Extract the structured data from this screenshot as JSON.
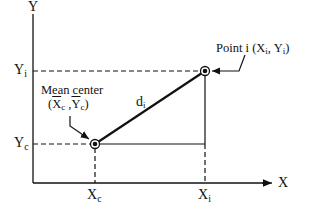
{
  "diagram": {
    "axes": {
      "x_label": "X",
      "y_label": "Y"
    },
    "points": {
      "point_i": {
        "label": "Point i",
        "coord_x": "X",
        "coord_x_sub": "i",
        "coord_y": "Y",
        "coord_y_sub": "i"
      },
      "mean_center": {
        "label": "Mean center",
        "coord_x": "X",
        "coord_x_sub": "c",
        "coord_y": "Y",
        "coord_y_sub": "c"
      }
    },
    "distance_label": "d",
    "distance_sub": "i",
    "ticks": {
      "xc": "X",
      "xc_sub": "c",
      "xi": "X",
      "xi_sub": "i",
      "yc": "Y",
      "yc_sub": "c",
      "yi": "Y",
      "yi_sub": "i"
    },
    "colors": {
      "ink": "#111111",
      "background": "#ffffff"
    }
  }
}
